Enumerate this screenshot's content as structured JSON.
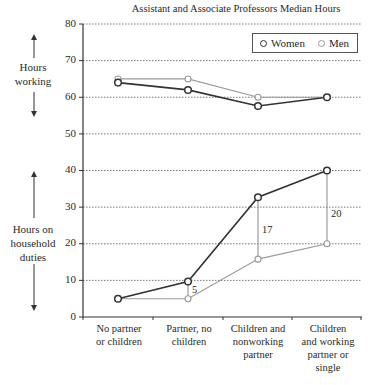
{
  "chart_data": {
    "type": "line",
    "title": "Assistant and Associate Professors Median Hours",
    "categories": [
      "No partner or children",
      "Partner, no children",
      "Children and nonworking partner",
      "Children and working partner or single"
    ],
    "category_lines": [
      [
        "No partner",
        "or children"
      ],
      [
        "Partner, no",
        "children"
      ],
      [
        "Children and",
        "nonworking",
        "partner"
      ],
      [
        "Children",
        "and working",
        "partner or",
        "single"
      ]
    ],
    "series": [
      {
        "name": "Women",
        "group": "Hours working",
        "values": [
          64,
          62,
          57.6,
          60
        ],
        "color": "#333333"
      },
      {
        "name": "Men",
        "group": "Hours working",
        "values": [
          65,
          65,
          60,
          60
        ],
        "color": "#999999"
      },
      {
        "name": "Women",
        "group": "Hours on household duties",
        "values": [
          5,
          9.7,
          32.7,
          40
        ],
        "color": "#333333"
      },
      {
        "name": "Men",
        "group": "Hours on household duties",
        "values": [
          5,
          5,
          15.8,
          20
        ],
        "color": "#999999"
      }
    ],
    "annotations": [
      {
        "category_index": 1,
        "text": "5"
      },
      {
        "category_index": 2,
        "text": "17"
      },
      {
        "category_index": 3,
        "text": "20"
      }
    ],
    "yticks": [
      0,
      10,
      20,
      30,
      40,
      50,
      60,
      70,
      80
    ],
    "ylim": [
      0,
      80
    ],
    "xlabel": "",
    "ylabel": "",
    "side_labels": {
      "upper": "Hours working",
      "lower": "Hours on household duties"
    },
    "grid": true,
    "legend": {
      "position": "top-right",
      "entries": [
        "Women",
        "Men"
      ]
    }
  },
  "text": {
    "title": "Assistant and Associate Professors Median Hours",
    "legend_women": "Women",
    "legend_men": "Men",
    "side_upper_1": "Hours",
    "side_upper_2": "working",
    "side_lower_1": "Hours on",
    "side_lower_2": "household",
    "side_lower_3": "duties",
    "y0": "0",
    "y10": "10",
    "y20": "20",
    "y30": "30",
    "y40": "40",
    "y50": "50",
    "y60": "60",
    "y70": "70",
    "y80": "80",
    "cat0_l1": "No partner",
    "cat0_l2": "or children",
    "cat1_l1": "Partner, no",
    "cat1_l2": "children",
    "cat2_l1": "Children and",
    "cat2_l2": "nonworking",
    "cat2_l3": "partner",
    "cat3_l1": "Children",
    "cat3_l2": "and working",
    "cat3_l3": "partner or",
    "cat3_l4": "single",
    "ann_5": "5",
    "ann_17": "17",
    "ann_20": "20"
  }
}
